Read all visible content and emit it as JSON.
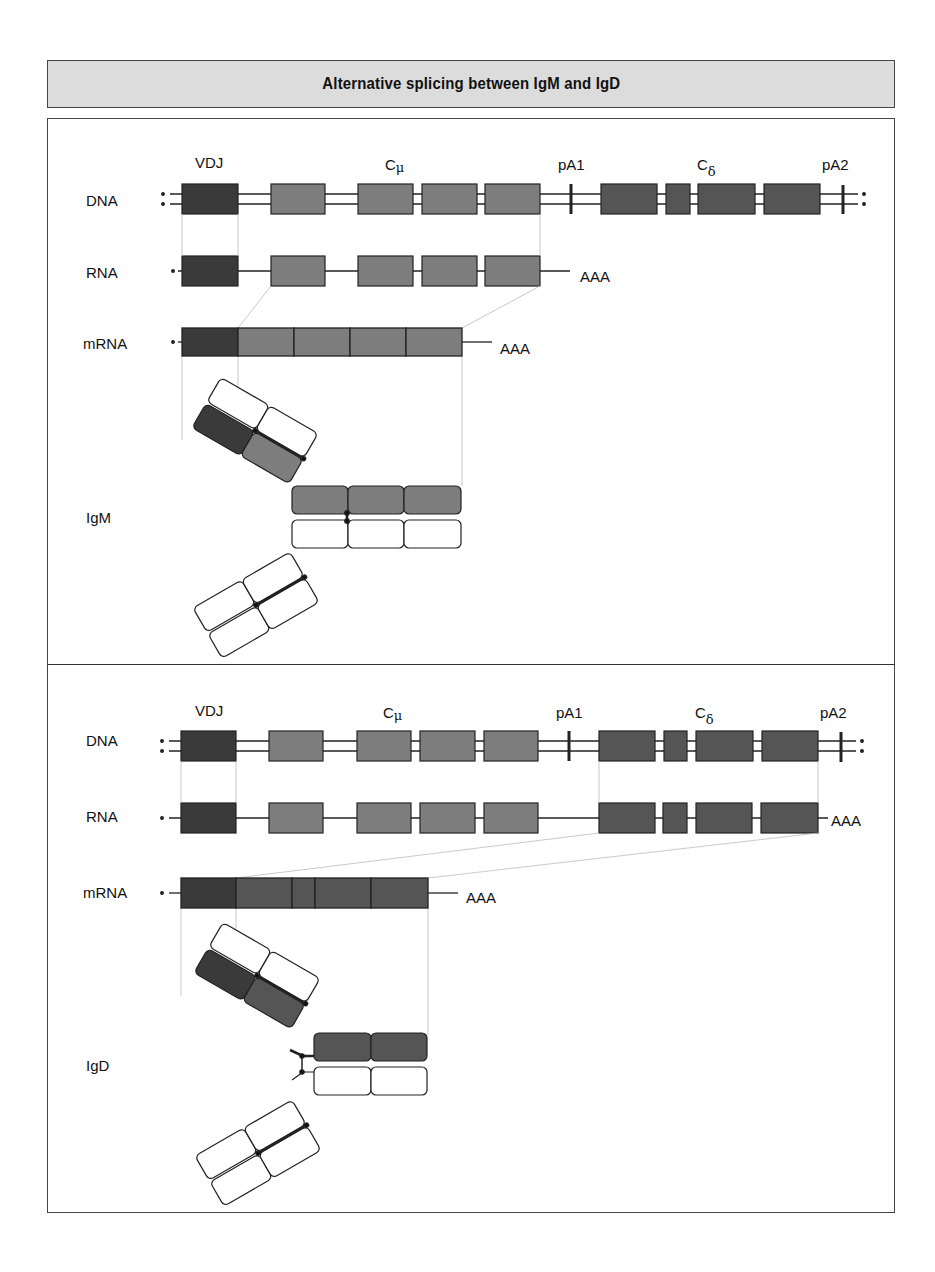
{
  "title": "Alternative splicing between IgM and IgD",
  "colors": {
    "vdj_exon": "#3a3a3a",
    "cmu_exon": "#7d7d7d",
    "cdelta_exon": "#555555",
    "title_background": "#dcdcdc",
    "guide_line": "#bbbbbb"
  },
  "panels": [
    {
      "id": "igm",
      "gene_labels": {
        "vdj": "VDJ",
        "cmu": "Cμ",
        "pa1": "pA1",
        "cdelta": "Cδ",
        "pa2": "pA2"
      },
      "row_labels": {
        "dna": "DNA",
        "rna": "RNA",
        "mrna": "mRNA"
      },
      "rna_tail": "AAA",
      "mrna_tail": "AAA",
      "protein_label": "IgM",
      "mrna_exons": [
        "VDJ",
        "Cμ1",
        "Cμ2",
        "Cμ3",
        "Cμ4"
      ],
      "poly_a_site_used": "pA1"
    },
    {
      "id": "igd",
      "gene_labels": {
        "vdj": "VDJ",
        "cmu": "Cμ",
        "pa1": "pA1",
        "cdelta": "Cδ",
        "pa2": "pA2"
      },
      "row_labels": {
        "dna": "DNA",
        "rna": "RNA",
        "mrna": "mRNA"
      },
      "rna_tail": "AAA",
      "mrna_tail": "AAA",
      "protein_label": "IgD",
      "mrna_exons": [
        "VDJ",
        "Cδ1",
        "Cδ-hinge",
        "Cδ2",
        "Cδ3"
      ],
      "poly_a_site_used": "pA2"
    }
  ]
}
